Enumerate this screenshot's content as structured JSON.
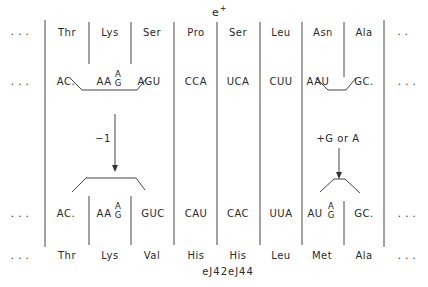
{
  "marker": {
    "label": "e",
    "superscript": "+"
  },
  "ellipsis": ". . .",
  "ellipsis_short": ". .",
  "top_amino_acids": [
    "Thr",
    "Lys",
    "Ser",
    "Pro",
    "Ser",
    "Leu",
    "Asn",
    "Ala"
  ],
  "top_codons": {
    "c1": "AC.",
    "c2_base": "AA",
    "c2_stack_top": "A",
    "c2_stack_bottom": "G",
    "c3": "AGU",
    "c4": "CCA",
    "c5": "UCA",
    "c6": "CUU",
    "c7": "AAU",
    "c8": "GC."
  },
  "mutation_left": {
    "label": "−1"
  },
  "mutation_right": {
    "label": "+G or A"
  },
  "bottom_codons": {
    "c1": "AC.",
    "c2_base": "AA",
    "c2_stack_top": "A",
    "c2_stack_bottom": "G",
    "c3": "GUC",
    "c4": "CAU",
    "c5": "CAC",
    "c6": "UUA",
    "c7_base": "AU",
    "c7_stack_top": "A",
    "c7_stack_bottom": "G",
    "c8": "GC."
  },
  "bottom_amino_acids": [
    "Thr",
    "Lys",
    "Val",
    "His",
    "His",
    "Leu",
    "Met",
    "Ala"
  ],
  "caption": "eJ42eJ44",
  "colors": {
    "ink": "#2a2a2a",
    "background": "#ffffff"
  }
}
